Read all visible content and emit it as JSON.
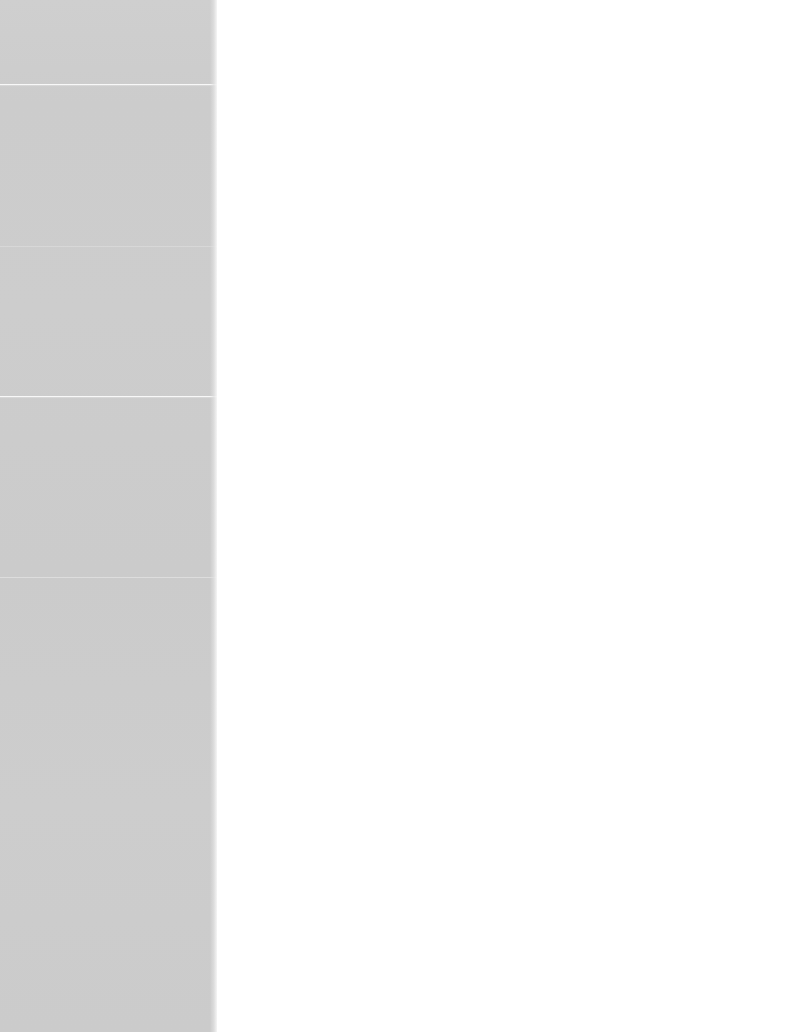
{
  "window": {
    "title": "",
    "state": "blank",
    "width": 790,
    "height": 1032
  },
  "colors": {
    "sidebar_background": "#cdcdcd",
    "content_background": "#ffffff",
    "divider": "#ffffff",
    "page_background": "#ffffff"
  },
  "sidebar": {
    "width": 217,
    "background": "#cdcdcd",
    "sections": [
      {
        "label": "",
        "top": 0,
        "height": 84,
        "divider": "strong"
      },
      {
        "label": "",
        "top": 84,
        "height": 162,
        "divider": "veryfaint"
      },
      {
        "label": "",
        "top": 246,
        "height": 150,
        "divider": "strong"
      },
      {
        "label": "",
        "top": 396,
        "height": 181,
        "divider": "faint"
      },
      {
        "label": "",
        "top": 577,
        "height": 455,
        "divider": "none"
      }
    ],
    "dividers": [
      {
        "name": "divider-1",
        "y": 84,
        "style": "strong"
      },
      {
        "name": "divider-2",
        "y": 246,
        "style": "veryfaint"
      },
      {
        "name": "divider-3",
        "y": 396,
        "style": "strong"
      },
      {
        "name": "divider-4",
        "y": 577,
        "style": "faint"
      }
    ]
  },
  "content": {
    "empty_message": "",
    "background": "#ffffff"
  }
}
